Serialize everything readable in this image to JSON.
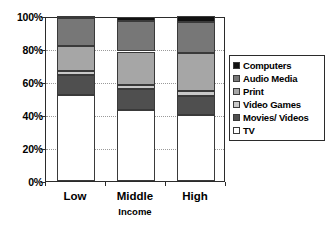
{
  "chart_data": {
    "type": "bar",
    "subtype": "stacked-100-percent",
    "title": "",
    "xlabel": "Income",
    "ylabel": "",
    "categories": [
      "Low",
      "Middle",
      "High"
    ],
    "ylim": [
      0,
      100
    ],
    "ytick_labels": [
      "0%",
      "20%",
      "40%",
      "60%",
      "80%",
      "100%"
    ],
    "ytick_values": [
      0,
      20,
      40,
      60,
      80,
      100
    ],
    "grid": true,
    "legend_position": "right",
    "stack_order_bottom_to_top": [
      "TV",
      "Movies/ Videos",
      "Video Games",
      "Print",
      "Audio Media",
      "Computers"
    ],
    "series": [
      {
        "name": "TV",
        "values": [
          52.0,
          43.0,
          40.0
        ],
        "color": "#ffffff"
      },
      {
        "name": "Movies/ Videos",
        "values": [
          12.0,
          13.0,
          11.5
        ],
        "color": "#4f4f4f"
      },
      {
        "name": "Video Games",
        "values": [
          2.5,
          2.0,
          3.0
        ],
        "color": "#c9c9c9"
      },
      {
        "name": "Print",
        "values": [
          15.5,
          20.5,
          23.0
        ],
        "color": "#a6a6a6"
      },
      {
        "name": "Audio Media",
        "values": [
          17.0,
          18.5,
          19.0
        ],
        "color": "#777777"
      },
      {
        "name": "Computers",
        "values": [
          1.0,
          2.5,
          3.5
        ],
        "color": "#111111"
      }
    ],
    "legend_entries": [
      {
        "label": "Computers",
        "color": "#111111"
      },
      {
        "label": "Audio Media",
        "color": "#777777"
      },
      {
        "label": "Print",
        "color": "#a6a6a6"
      },
      {
        "label": "Video Games",
        "color": "#c9c9c9"
      },
      {
        "label": "Movies/ Videos",
        "color": "#4f4f4f"
      },
      {
        "label": "TV",
        "color": "#ffffff"
      }
    ]
  }
}
